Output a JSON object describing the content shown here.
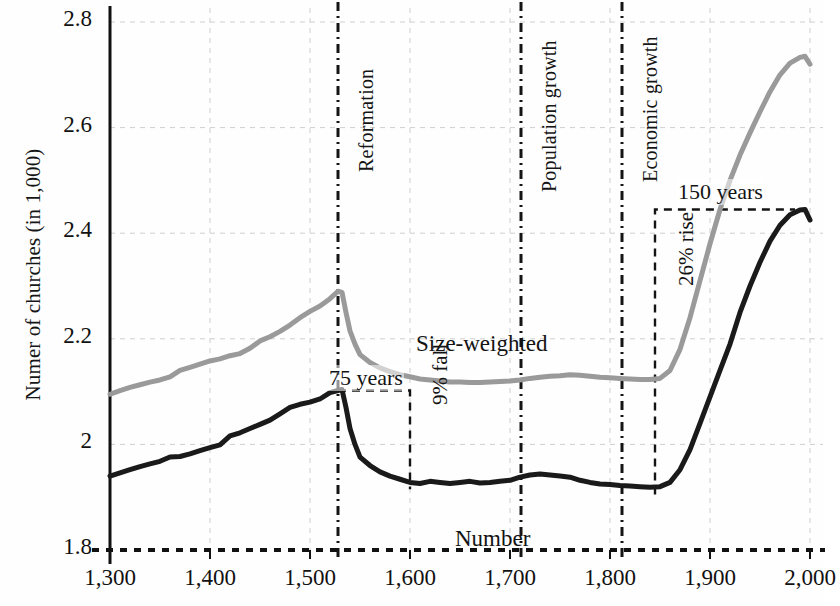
{
  "chart_data": {
    "type": "line",
    "title": "",
    "xlabel": "",
    "ylabel": "Numer of churches (in 1,000)",
    "xlim": [
      1300,
      2000
    ],
    "ylim": [
      1.8,
      2.8
    ],
    "yticks": [
      "1.8",
      "2",
      "2.2",
      "2.4",
      "2.6",
      "2.8"
    ],
    "ytick_values": [
      1.8,
      2.0,
      2.2,
      2.4,
      2.6,
      2.8
    ],
    "xticks": [
      "1,300",
      "1,400",
      "1,500",
      "1,600",
      "1,700",
      "1,800",
      "1,900",
      "2,000"
    ],
    "xtick_values": [
      1300,
      1400,
      1500,
      1600,
      1700,
      1800,
      1900,
      2000
    ],
    "grid": true,
    "legend": "inline-labels",
    "series": [
      {
        "name": "Size-weighted",
        "color": "#9a9a9a",
        "x": [
          1300,
          1310,
          1320,
          1330,
          1340,
          1350,
          1360,
          1370,
          1380,
          1390,
          1400,
          1410,
          1420,
          1430,
          1440,
          1450,
          1460,
          1470,
          1480,
          1490,
          1500,
          1510,
          1520,
          1528,
          1532,
          1536,
          1540,
          1545,
          1550,
          1560,
          1570,
          1580,
          1590,
          1600,
          1610,
          1620,
          1630,
          1640,
          1650,
          1660,
          1670,
          1680,
          1690,
          1700,
          1710,
          1720,
          1730,
          1740,
          1750,
          1760,
          1770,
          1780,
          1790,
          1800,
          1810,
          1820,
          1830,
          1840,
          1850,
          1860,
          1870,
          1880,
          1890,
          1900,
          1910,
          1920,
          1930,
          1940,
          1950,
          1960,
          1970,
          1980,
          1990,
          1995,
          2000
        ],
        "y": [
          2.095,
          2.102,
          2.108,
          2.113,
          2.118,
          2.122,
          2.128,
          2.14,
          2.146,
          2.152,
          2.158,
          2.162,
          2.168,
          2.172,
          2.182,
          2.196,
          2.204,
          2.214,
          2.226,
          2.24,
          2.252,
          2.262,
          2.276,
          2.29,
          2.288,
          2.25,
          2.215,
          2.19,
          2.17,
          2.155,
          2.145,
          2.138,
          2.132,
          2.128,
          2.124,
          2.122,
          2.12,
          2.118,
          2.118,
          2.117,
          2.117,
          2.118,
          2.119,
          2.12,
          2.122,
          2.125,
          2.127,
          2.129,
          2.13,
          2.132,
          2.131,
          2.129,
          2.127,
          2.126,
          2.125,
          2.124,
          2.123,
          2.123,
          2.125,
          2.14,
          2.18,
          2.24,
          2.31,
          2.38,
          2.445,
          2.5,
          2.548,
          2.59,
          2.63,
          2.668,
          2.7,
          2.722,
          2.733,
          2.735,
          2.72
        ]
      },
      {
        "name": "Number",
        "color": "#1a1a1a",
        "x": [
          1300,
          1310,
          1320,
          1330,
          1340,
          1350,
          1360,
          1370,
          1380,
          1390,
          1400,
          1410,
          1420,
          1430,
          1440,
          1450,
          1460,
          1470,
          1480,
          1490,
          1500,
          1510,
          1520,
          1528,
          1532,
          1536,
          1540,
          1545,
          1550,
          1560,
          1570,
          1580,
          1590,
          1600,
          1610,
          1620,
          1630,
          1640,
          1650,
          1660,
          1670,
          1680,
          1690,
          1700,
          1710,
          1720,
          1730,
          1740,
          1750,
          1760,
          1770,
          1780,
          1790,
          1800,
          1810,
          1820,
          1830,
          1840,
          1850,
          1860,
          1870,
          1880,
          1890,
          1900,
          1910,
          1920,
          1930,
          1940,
          1950,
          1960,
          1970,
          1980,
          1990,
          1995,
          2000
        ],
        "y": [
          1.94,
          1.946,
          1.952,
          1.958,
          1.963,
          1.968,
          1.976,
          1.977,
          1.982,
          1.988,
          1.994,
          1.999,
          2.016,
          2.022,
          2.03,
          2.038,
          2.046,
          2.058,
          2.07,
          2.076,
          2.08,
          2.086,
          2.098,
          2.102,
          2.104,
          2.07,
          2.03,
          2.0,
          1.976,
          1.96,
          1.948,
          1.94,
          1.934,
          1.928,
          1.926,
          1.93,
          1.928,
          1.926,
          1.928,
          1.93,
          1.927,
          1.928,
          1.93,
          1.932,
          1.938,
          1.942,
          1.944,
          1.942,
          1.94,
          1.938,
          1.932,
          1.928,
          1.925,
          1.924,
          1.922,
          1.921,
          1.92,
          1.919,
          1.92,
          1.928,
          1.952,
          1.99,
          2.04,
          2.09,
          2.14,
          2.19,
          2.25,
          2.3,
          2.345,
          2.385,
          2.415,
          2.435,
          2.444,
          2.445,
          2.425
        ]
      }
    ],
    "vertical_markers": [
      {
        "label": "Reformation",
        "x": 1528
      },
      {
        "label": "Population growth",
        "x": 1711
      },
      {
        "label": "Economic growth",
        "x": 1812
      }
    ],
    "annotations": [
      {
        "label": "75 years",
        "x_start": 1528,
        "x_end": 1600,
        "y": 2.102
      },
      {
        "label": "9% fall",
        "x": 1600,
        "y_top": 2.102,
        "y_bottom": 1.928
      },
      {
        "label": "150 years",
        "x_start": 1845,
        "x_end": 1985,
        "y": 2.445
      },
      {
        "label": "26% rise",
        "x": 1845,
        "y_top": 2.445,
        "y_bottom": 1.92
      },
      {
        "label": "Size-weighted",
        "x": 1640,
        "y": 2.19
      },
      {
        "label": "Number",
        "x": 1640,
        "y": 1.866
      }
    ],
    "colors": {
      "size_weighted": "#9a9a9a",
      "number": "#1a1a1a",
      "axis": "#111111",
      "grid": "#cfcfcf",
      "annotation": "#131313"
    }
  }
}
